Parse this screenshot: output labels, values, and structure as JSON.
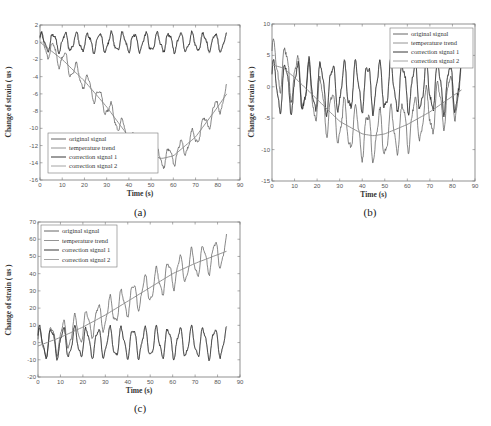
{
  "chart_data": [
    {
      "panel": "(a)",
      "type": "line",
      "xlabel": "Time (s)",
      "ylabel": "Change of strain ( us )",
      "xlim": [
        0,
        90
      ],
      "ylim": [
        -16,
        2
      ],
      "xticks": [
        0,
        10,
        20,
        30,
        40,
        50,
        60,
        70,
        80,
        90
      ],
      "yticks": [
        2,
        0,
        -2,
        -4,
        -6,
        -8,
        -10,
        -12,
        -14,
        -16
      ],
      "grid": false,
      "legend_position": "lower left",
      "legend": [
        "original signal",
        "temperature trend",
        "correction signal 1",
        "correction signal 2"
      ],
      "series": [
        {
          "name": "original signal",
          "description": "oscillation (period ~5s, amp ~2) superimposed on trend; starts ~0, minimum ~-14.5 near t=55, rises to ~-6 at t=84",
          "trend_x": [
            0,
            10,
            20,
            30,
            40,
            50,
            55,
            60,
            70,
            80,
            84
          ],
          "trend_y": [
            0,
            -2,
            -4.5,
            -7.5,
            -11,
            -13.2,
            -13.5,
            -13.2,
            -11,
            -7.5,
            -6
          ]
        },
        {
          "name": "temperature trend",
          "x": [
            0,
            10,
            20,
            30,
            40,
            50,
            55,
            60,
            70,
            80,
            84
          ],
          "y": [
            0,
            -2,
            -4.5,
            -7.5,
            -11,
            -13.2,
            -13.5,
            -13.2,
            -11,
            -7.5,
            -6
          ]
        },
        {
          "name": "correction signal 1",
          "description": "oscillation around 0, amplitude ~1, period ~5s, range -1.5 to 1.5; ends near -2 at t=84"
        },
        {
          "name": "correction signal 2",
          "description": "nearly identical to correction signal 1"
        }
      ],
      "caption": "(a)"
    },
    {
      "panel": "(b)",
      "type": "line",
      "xlabel": "Time (s)",
      "ylabel": "Change of strain ( us )",
      "xlim": [
        0,
        90
      ],
      "ylim": [
        -15,
        10
      ],
      "xticks": [
        0,
        10,
        20,
        30,
        40,
        50,
        60,
        70,
        80,
        90
      ],
      "yticks": [
        10,
        5,
        0,
        -5,
        -10,
        -15
      ],
      "grid": false,
      "legend_position": "upper right",
      "legend": [
        "original signal",
        "temperature trend",
        "correction signal 1",
        "correction signal 2"
      ],
      "series": [
        {
          "name": "original signal",
          "description": "oscillation (period ~5s, amp ~3.5) superimposed on trend; peak ~7.5 near t=6, min ~-12 near t=60"
        },
        {
          "name": "temperature trend",
          "x": [
            0,
            5,
            10,
            20,
            30,
            40,
            45,
            50,
            60,
            70,
            80,
            84
          ],
          "y": [
            3.5,
            3,
            1.5,
            -2,
            -5.5,
            -7.5,
            -7.8,
            -7.5,
            -6,
            -4,
            -1.5,
            -0.5
          ]
        },
        {
          "name": "correction signal 1",
          "description": "oscillation around 0, amplitude ~3.5, period ~5s, range ~-4 to 4.5"
        },
        {
          "name": "correction signal 2",
          "description": "nearly identical to correction signal 1"
        }
      ],
      "caption": "(b)"
    },
    {
      "panel": "(c)",
      "type": "line",
      "xlabel": "Time (s)",
      "ylabel": "Change of strain ( us )",
      "xlim": [
        0,
        90
      ],
      "ylim": [
        -20,
        70
      ],
      "xticks": [
        0,
        10,
        20,
        30,
        40,
        50,
        60,
        70,
        80,
        90
      ],
      "yticks": [
        70,
        60,
        50,
        40,
        30,
        20,
        10,
        0,
        -10,
        -20
      ],
      "grid": false,
      "legend_position": "upper left",
      "legend": [
        "original signal",
        "temperature trend",
        "correction signal 1",
        "correction signal 2"
      ],
      "series": [
        {
          "name": "original signal",
          "description": "oscillation (period ~5s, amp ~8) superimposed on rising trend; ends ~60 peak near t=82"
        },
        {
          "name": "temperature trend",
          "x": [
            0,
            10,
            20,
            30,
            40,
            50,
            60,
            70,
            80,
            84
          ],
          "y": [
            -2,
            3,
            9,
            16,
            24,
            32,
            40,
            46,
            51,
            53
          ]
        },
        {
          "name": "correction signal 1",
          "description": "oscillation around 0, amplitude ~8, period ~5s, range ~-10 to 8"
        },
        {
          "name": "correction signal 2",
          "description": "nearly identical to correction signal 1"
        }
      ],
      "caption": "(c)"
    }
  ],
  "panels": {
    "a": {
      "xlabel": "Time (s)",
      "ylabel": "Change of strain ( us )",
      "caption": "(a)",
      "xticks": [
        "0",
        "10",
        "20",
        "30",
        "40",
        "50",
        "60",
        "70",
        "80",
        "90"
      ],
      "yticks": [
        "2",
        "0",
        "-2",
        "-4",
        "-6",
        "-8",
        "-10",
        "-12",
        "-14",
        "-16"
      ],
      "legend": [
        "original signal",
        "temperature trend",
        "correction signal 1",
        "correction signal 2"
      ]
    },
    "b": {
      "xlabel": "Time (s)",
      "ylabel": "Change of strain ( us )",
      "caption": "(b)",
      "xticks": [
        "0",
        "10",
        "20",
        "30",
        "40",
        "50",
        "60",
        "70",
        "80",
        "90"
      ],
      "yticks": [
        "10",
        "5",
        "0",
        "-5",
        "-10",
        "-15"
      ],
      "legend": [
        "original signal",
        "temperature trend",
        "correction signal 1",
        "correction signal 2"
      ]
    },
    "c": {
      "xlabel": "Time (s)",
      "ylabel": "Change of strain ( us )",
      "caption": "(c)",
      "xticks": [
        "0",
        "10",
        "20",
        "30",
        "40",
        "50",
        "60",
        "70",
        "80",
        "90"
      ],
      "yticks": [
        "70",
        "60",
        "50",
        "40",
        "30",
        "20",
        "10",
        "0",
        "-10",
        "-20"
      ],
      "legend": [
        "original signal",
        "temperature trend",
        "correction signal 1",
        "correction signal 2"
      ]
    }
  },
  "colors": {
    "original": "#555555",
    "trend": "#888888",
    "corr1": "#222222",
    "corr2": "#9a9a9a",
    "axis": "#777777"
  }
}
